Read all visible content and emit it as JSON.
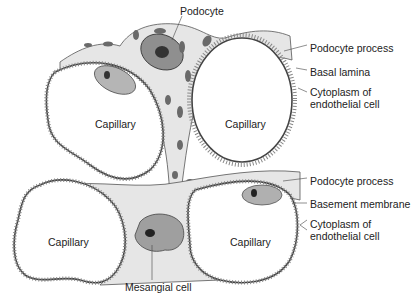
{
  "diagram": {
    "labels": {
      "podocyte": "Podocyte",
      "top_podocyte_process": "Podocyte process",
      "basal_lamina": "Basal lamina",
      "top_cytoplasm_line1": "Cytoplasm of",
      "top_cytoplasm_line2": "endothelial cell",
      "bottom_podocyte_process": "Podocyte process",
      "basement_membrane": "Basement membrane",
      "bottom_cytoplasm_line1": "Cytoplasm of",
      "bottom_cytoplasm_line2": "endothelial cell",
      "mesangial_cell": "Mesangial cell"
    },
    "capillaries": [
      {
        "label": "Capillary",
        "position": "top-left"
      },
      {
        "label": "Capillary",
        "position": "top-right"
      },
      {
        "label": "Capillary",
        "position": "bottom-left"
      },
      {
        "label": "Capillary",
        "position": "bottom-right"
      }
    ],
    "colors": {
      "cytoplasm": "#e4e4e4",
      "nucleus": "#9a9a9a",
      "nucleolus": "#333333",
      "outline": "#444444",
      "organelle": "#6a6a6a"
    }
  }
}
